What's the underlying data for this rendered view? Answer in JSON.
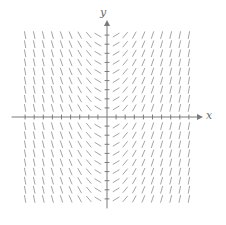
{
  "chart_data": {
    "type": "slope_field",
    "title": "",
    "xlabel": "x",
    "ylabel": "y",
    "equation_estimate": "dy/dx = k·x (slope depends only on x; negative for x<0, positive for x>0, steeper with |x|)",
    "x_grid": [
      -9,
      -8,
      -7,
      -6,
      -5,
      -4,
      -3,
      -2,
      -1,
      0,
      1,
      2,
      3,
      4,
      5,
      6,
      7,
      8,
      9
    ],
    "y_grid": [
      -9,
      -8,
      -7,
      -6,
      -5,
      -4,
      -3,
      -2,
      -1,
      0,
      1,
      2,
      3,
      4,
      5,
      6,
      7,
      8,
      9
    ],
    "slope_scale_k": 0.6,
    "grid_on": false,
    "axis_ticks": "tick at every grid unit on both axes",
    "colors": {
      "axis": "#7a7a7a",
      "segments": "#9a9a9a",
      "labels": "#6b6b6b"
    }
  },
  "labels": {
    "x": "x",
    "y": "y"
  },
  "layout": {
    "origin_px": [
      107,
      117
    ],
    "unit_px": 9.1,
    "segment_len_px": 7,
    "x_axis_px": [
      12,
      203
    ],
    "y_axis_px": [
      20,
      208
    ]
  }
}
